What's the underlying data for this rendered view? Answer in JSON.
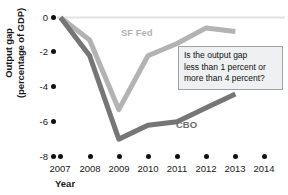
{
  "chart_data": {
    "type": "line",
    "title": "",
    "xlabel": "Year",
    "ylabel": "Output gap (percentage of GDP)",
    "ylabel_line1": "Output gap",
    "ylabel_line2": "(percentage of GDP)",
    "x": [
      2007,
      2008,
      2009,
      2010,
      2011,
      2012,
      2013,
      2014
    ],
    "categories": [
      "2007",
      "2008",
      "2009",
      "2010",
      "2011",
      "2012",
      "2013",
      "2014"
    ],
    "xlim": [
      2007,
      2014
    ],
    "ylim": [
      -8,
      0
    ],
    "yticks": [
      0,
      -2,
      -4,
      -6,
      -8
    ],
    "ytick_labels": [
      "0",
      "-2",
      "-4",
      "-6",
      "-8"
    ],
    "grid": false,
    "legend_position": "inline-annotations",
    "series": [
      {
        "name": "SF Fed",
        "color": "#b3b3b3",
        "label_color": "#b3b3b3",
        "x": [
          2007,
          2008,
          2009,
          2010,
          2011,
          2012,
          2013
        ],
        "values": [
          0,
          -1.3,
          -5.3,
          -2.2,
          -1.5,
          -0.6,
          -0.8
        ]
      },
      {
        "name": "CBO",
        "color": "#767676",
        "label_color": "#6b6b6b",
        "x": [
          2007,
          2008,
          2009,
          2010,
          2011,
          2012,
          2013
        ],
        "values": [
          0,
          -2.2,
          -7.0,
          -6.2,
          -6.0,
          -5.2,
          -4.4
        ]
      }
    ],
    "annotations": [
      {
        "name": "question-callout",
        "lines": [
          "Is the output gap",
          "less than 1 percent or",
          "more than 4 percent?"
        ],
        "border_color": "#9aa3ad",
        "background": "#eef0f2"
      }
    ]
  }
}
